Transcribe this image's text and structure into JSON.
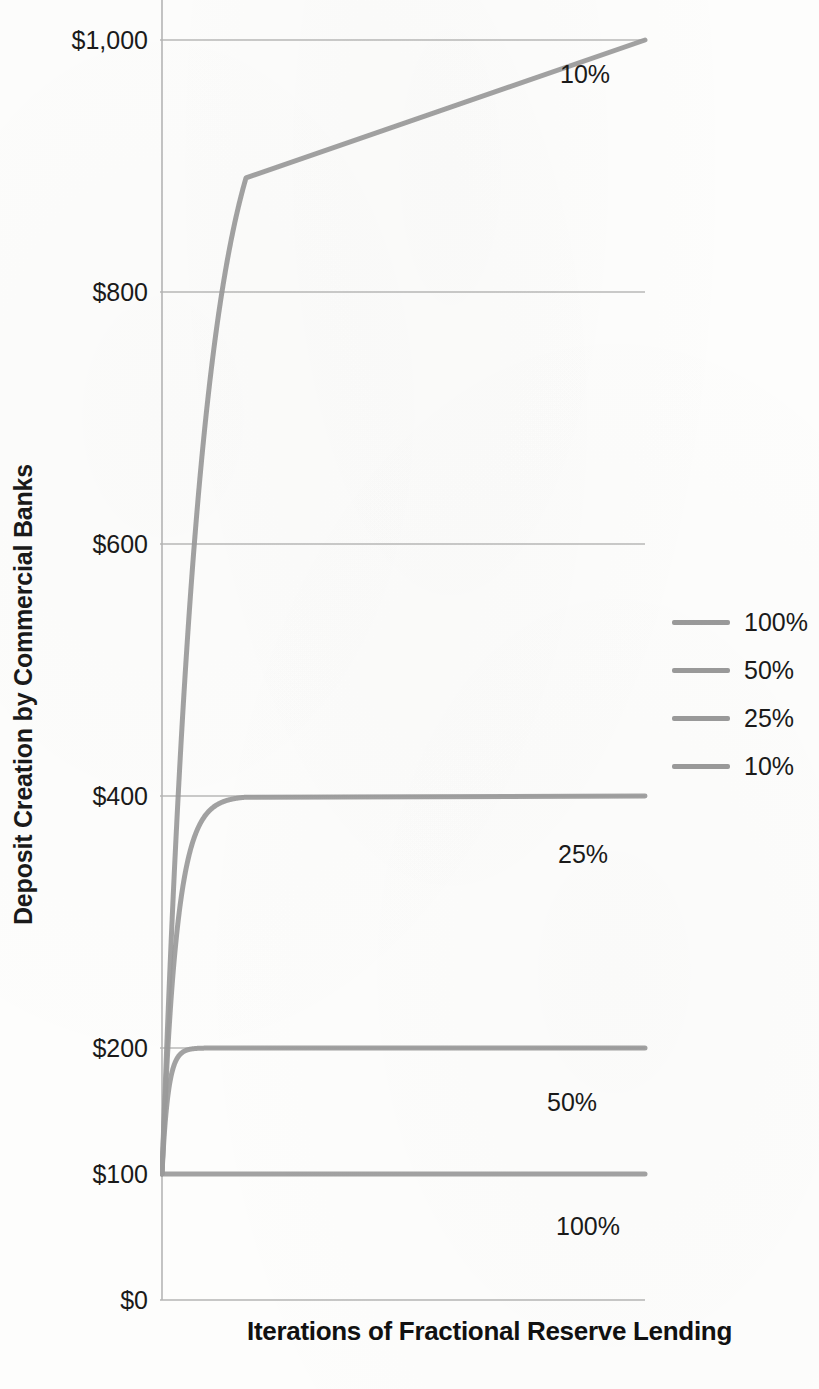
{
  "chart_data": {
    "type": "line",
    "title": "",
    "xlabel": "Iterations of Fractional Reserve Lending",
    "ylabel": "Deposit Creation by Commercial Banks",
    "ylim": [
      0,
      1060
    ],
    "xlim": [
      0,
      20
    ],
    "grid": true,
    "y_ticks": [
      {
        "value": 0,
        "label": "$0"
      },
      {
        "value": 100,
        "label": "$100"
      },
      {
        "value": 200,
        "label": "$200"
      },
      {
        "value": 400,
        "label": "$400"
      },
      {
        "value": 600,
        "label": "$600"
      },
      {
        "value": 800,
        "label": "$800"
      },
      {
        "value": 1000,
        "label": "$1,000"
      }
    ],
    "gridline_values": [
      200,
      400,
      600,
      800,
      1000
    ],
    "x_tick_labels": [],
    "legend_position": "right",
    "series": [
      {
        "name": "100%",
        "reserve_ratio": 1.0,
        "asymptote": 100,
        "color": "#9a9a9a",
        "end_label": "100%",
        "values": [
          100,
          100,
          100,
          100,
          100,
          100,
          100,
          100,
          100,
          100,
          100,
          100,
          100,
          100,
          100,
          100,
          100,
          100,
          100,
          100,
          100
        ]
      },
      {
        "name": "50%",
        "reserve_ratio": 0.5,
        "asymptote": 200,
        "color": "#9a9a9a",
        "end_label": "50%",
        "values": [
          100,
          150,
          175,
          187.5,
          193.8,
          196.9,
          198.4,
          199.2,
          199.6,
          199.8,
          199.9,
          200,
          200,
          200,
          200,
          200,
          200,
          200,
          200,
          200,
          200
        ]
      },
      {
        "name": "25%",
        "reserve_ratio": 0.25,
        "asymptote": 400,
        "color": "#9a9a9a",
        "end_label": "25%",
        "values": [
          100,
          175,
          231.3,
          273.4,
          305.1,
          328.8,
          346.6,
          360,
          370,
          377.5,
          383.1,
          387.3,
          390.5,
          392.9,
          394.7,
          396,
          397,
          397.7,
          398.3,
          398.7,
          399
        ]
      },
      {
        "name": "10%",
        "reserve_ratio": 0.1,
        "asymptote": 1000,
        "color": "#9a9a9a",
        "end_label": "10%",
        "values": [
          100,
          190,
          271,
          343.9,
          409.5,
          468.6,
          521.7,
          569.5,
          612.6,
          651.3,
          686.2,
          717.6,
          745.8,
          771.2,
          794.1,
          814.7,
          833.2,
          849.9,
          864.9,
          878.4,
          890.6
        ]
      }
    ]
  },
  "legend": {
    "items": [
      {
        "label": "100%",
        "color": "#9a9a9a"
      },
      {
        "label": "50%",
        "color": "#9a9a9a"
      },
      {
        "label": "25%",
        "color": "#9a9a9a"
      },
      {
        "label": "10%",
        "color": "#9a9a9a"
      }
    ]
  },
  "annotations": [
    {
      "label": "10%",
      "x": 560,
      "y": 60
    },
    {
      "label": "25%",
      "x": 558,
      "y": 840
    },
    {
      "label": "50%",
      "x": 547,
      "y": 1088
    },
    {
      "label": "100%",
      "x": 556,
      "y": 1212
    }
  ],
  "style": {
    "curve_color": "#9a9a9a",
    "grid_color": "#b9b9b9",
    "axis_color": "#b5b5b5",
    "text_color": "#1a1a1a",
    "background": "#fdfdfc"
  }
}
